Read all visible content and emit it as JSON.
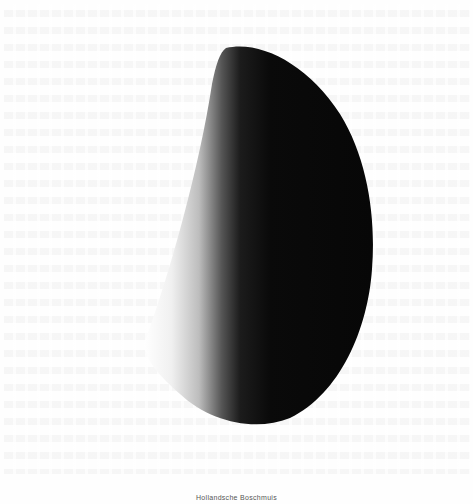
{
  "page": {
    "background_color": "#fefefe",
    "show_through_text": "faint illegible reverse-side text lines"
  },
  "illustration": {
    "subject": "crescent-egg-shaped dark orb, lit from the left",
    "dark_color": "#0a0a0a",
    "light_color": "#ffffff"
  },
  "caption": {
    "text": "Hollandsche Boschmuis"
  }
}
